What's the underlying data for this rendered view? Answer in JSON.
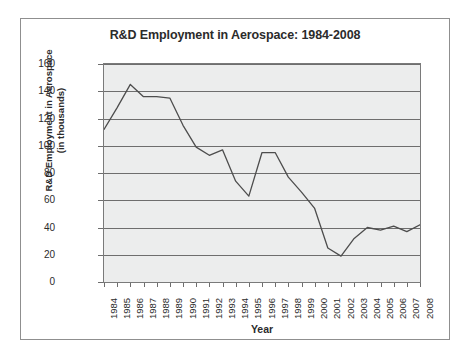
{
  "chart_data": {
    "type": "line",
    "title": "R&D Employment in Aerospace: 1984-2008",
    "xlabel": "Year",
    "ylabel": "R&D Employment in Aerospace (in thousands)",
    "ylabel_line1": "R&D Employment in Aerospace",
    "ylabel_line2": "(in thousands)",
    "ylim": [
      0,
      160
    ],
    "ytick_step": 20,
    "yticks": [
      160,
      140,
      120,
      100,
      80,
      60,
      40,
      20,
      0
    ],
    "grid": true,
    "legend": null,
    "line_color": "#4d4d4d",
    "plot_background": "#eceded",
    "categories": [
      "1984",
      "1985",
      "1986",
      "1987",
      "1988",
      "1989",
      "1990",
      "1991",
      "1992",
      "1993",
      "1994",
      "1995",
      "1996",
      "1997",
      "1998",
      "1999",
      "2000",
      "2001",
      "2002",
      "2003",
      "2004",
      "2005",
      "2006",
      "2007",
      "2008"
    ],
    "series": [
      {
        "name": "R&D Employment in Aerospace",
        "values": [
          112,
          128,
          145,
          136,
          136,
          135,
          115,
          99,
          93,
          97,
          74,
          63,
          95,
          95,
          77,
          66,
          54,
          25,
          19,
          32,
          40,
          38,
          41,
          37,
          42
        ]
      }
    ]
  }
}
